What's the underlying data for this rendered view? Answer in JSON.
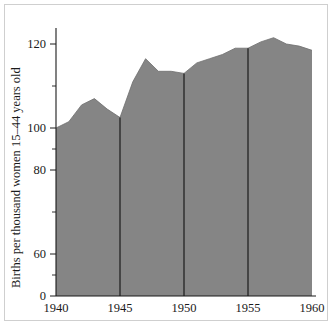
{
  "chart_data": {
    "type": "area",
    "title": "",
    "xlabel": "",
    "ylabel": "Births per thousand women 15–44 years old",
    "x": [
      1940,
      1941,
      1942,
      1943,
      1944,
      1945,
      1946,
      1947,
      1948,
      1949,
      1950,
      1951,
      1952,
      1953,
      1954,
      1955,
      1956,
      1957,
      1958,
      1959,
      1960
    ],
    "values": [
      80,
      83,
      91,
      94,
      89,
      85,
      102,
      113,
      107,
      107,
      106,
      111,
      113,
      115,
      118,
      118,
      121,
      123,
      120,
      119,
      117
    ],
    "series": [
      {
        "name": "Birth rate",
        "values": [
          80,
          83,
          91,
          94,
          89,
          85,
          102,
          113,
          107,
          107,
          106,
          111,
          113,
          115,
          118,
          118,
          121,
          123,
          120,
          119,
          117
        ]
      }
    ],
    "xlim": [
      1940,
      1960
    ],
    "ylim": [
      0,
      128
    ],
    "xticks": [
      1940,
      1945,
      1950,
      1955,
      1960
    ],
    "xtick_labels": [
      "1940",
      "1945",
      "1950",
      "1955",
      "1960"
    ],
    "yticks": [
      0,
      60,
      80,
      100,
      120
    ],
    "ytick_labels": [
      "0",
      "60",
      "80",
      "100",
      "120"
    ],
    "y_minor_ticks": [
      50,
      70,
      90,
      110
    ],
    "vertical_rules": [
      1945,
      1950,
      1955
    ],
    "grid": false,
    "legend": "none",
    "fill_color": "#858585",
    "axis_color": "#1a1a1a",
    "rule_color": "#111111",
    "background": "#ffffff",
    "frame_color": "#cfcfcf"
  },
  "axes": {
    "y_title": "Births per thousand women 15–44 years old",
    "y_labels": {
      "t120": "120",
      "t100": "100",
      "t80": "80",
      "t60": "60",
      "t0": "0"
    },
    "x_labels": {
      "t1940": "1940",
      "t1945": "1945",
      "t1950": "1950",
      "t1955": "1955",
      "t1960": "1960"
    }
  }
}
